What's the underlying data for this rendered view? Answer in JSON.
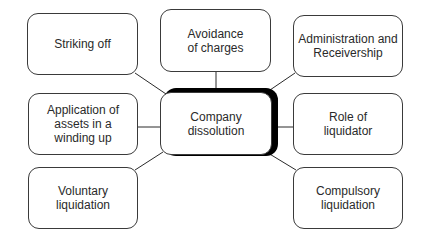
{
  "diagram": {
    "type": "mind-map",
    "center": {
      "label": "Company\ndissolution"
    },
    "nodes": [
      {
        "id": "striking-off",
        "label": "Striking off"
      },
      {
        "id": "avoidance-of-charges",
        "label": "Avoidance\nof charges"
      },
      {
        "id": "administration-and-receivership",
        "label": "Administration and\nReceivership"
      },
      {
        "id": "application-of-assets",
        "label": "Application of\nassets in a\nwinding up"
      },
      {
        "id": "role-of-liquidator",
        "label": "Role of\nliquidator"
      },
      {
        "id": "voluntary-liquidation",
        "label": "Voluntary\nliquidation"
      },
      {
        "id": "compulsory-liquidation",
        "label": "Compulsory\nliquidation"
      }
    ],
    "edges": [
      {
        "from": "center",
        "to": "striking-off"
      },
      {
        "from": "center",
        "to": "avoidance-of-charges"
      },
      {
        "from": "center",
        "to": "administration-and-receivership"
      },
      {
        "from": "center",
        "to": "application-of-assets"
      },
      {
        "from": "center",
        "to": "role-of-liquidator"
      },
      {
        "from": "center",
        "to": "voluntary-liquidation"
      },
      {
        "from": "center",
        "to": "compulsory-liquidation"
      }
    ],
    "colors": {
      "line": "#2a2a2a",
      "border": "#3a3a3a",
      "text": "#2a2a2a",
      "shadow": "#000000",
      "background": "#ffffff"
    }
  }
}
